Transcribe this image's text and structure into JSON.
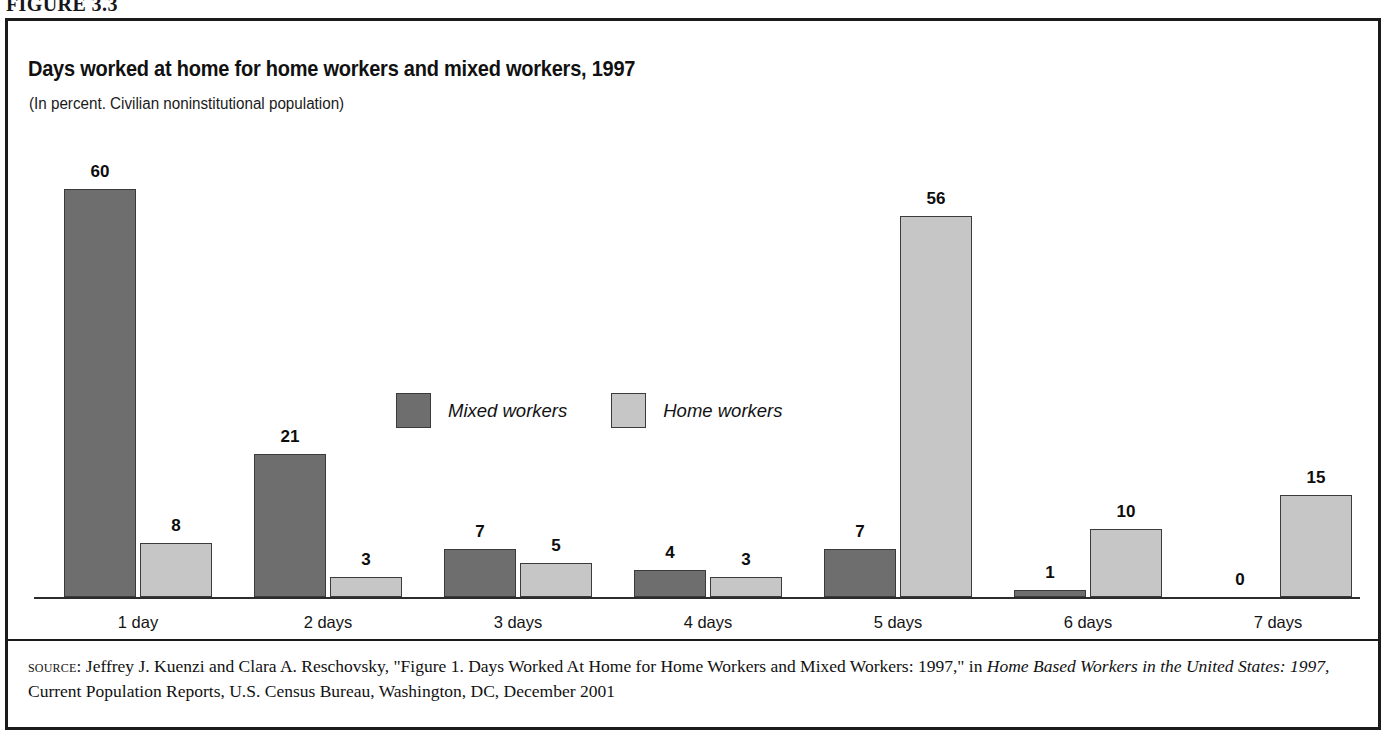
{
  "figure": {
    "caption": "FIGURE 3.3"
  },
  "chart_title": "Days worked at home for home workers and mixed workers, 1997",
  "chart_subtitle": "(In percent. Civilian noninstitutional population)",
  "legend": {
    "items": [
      {
        "label": "Mixed workers",
        "color": "#6e6e6e",
        "swatch_name": "legend-swatch-mixed-workers"
      },
      {
        "label": "Home workers",
        "color": "#c6c6c6",
        "swatch_name": "legend-swatch-home-workers"
      }
    ]
  },
  "source": {
    "label": "source:",
    "text_part1": " Jeffrey J. Kuenzi and Clara A. Reschovsky, \"Figure 1. Days Worked At Home for Home Workers and Mixed Workers: 1997,\" in ",
    "italic1": "Home Based Workers in the United States: 1997,",
    "text_part2": " Current Population Reports, U.S. Census Bureau, Washington, DC, December 2001"
  },
  "chart_data": {
    "type": "bar",
    "title": "Days worked at home for home workers and mixed workers, 1997",
    "subtitle": "(In percent. Civilian noninstitutional population)",
    "xlabel": "",
    "ylabel": "Percent",
    "ylim": [
      0,
      60
    ],
    "grid": false,
    "legend_position": "inside-upper-center",
    "categories": [
      "1 day",
      "2 days",
      "3 days",
      "4 days",
      "5 days",
      "6 days",
      "7 days"
    ],
    "series": [
      {
        "name": "Mixed workers",
        "color": "#6e6e6e",
        "values": [
          60,
          21,
          7,
          4,
          7,
          1,
          0
        ]
      },
      {
        "name": "Home workers",
        "color": "#c6c6c6",
        "values": [
          8,
          3,
          5,
          3,
          56,
          10,
          15
        ]
      }
    ]
  }
}
